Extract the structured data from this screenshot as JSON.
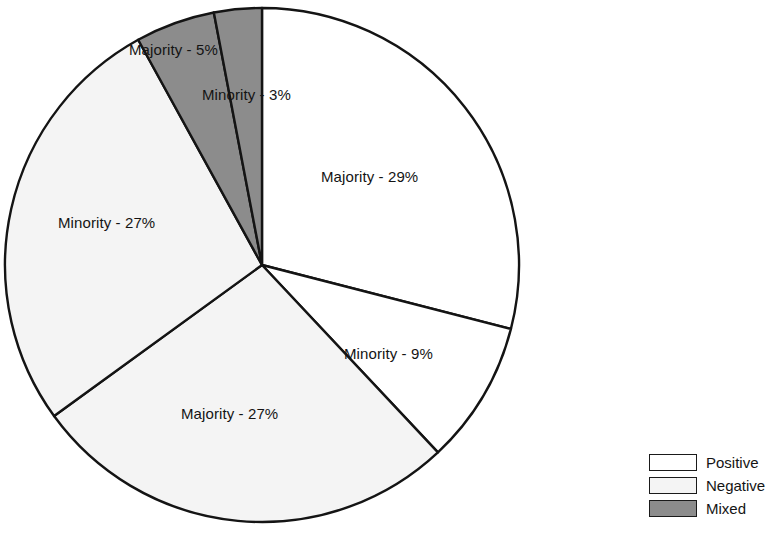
{
  "chart_data": {
    "type": "pie",
    "title": "",
    "subtitle": "",
    "xlabel": "",
    "ylabel": "",
    "grid": false,
    "legend_position": "bottom-right",
    "start_angle_deg": 0,
    "direction": "clockwise",
    "categories": [
      "Majority - 29%",
      "Minority - 9%",
      "Majority - 27%",
      "Minority - 27%",
      "Majority - 5%",
      "Minority - 3%"
    ],
    "values": [
      29,
      9,
      27,
      27,
      5,
      3
    ],
    "slices": [
      {
        "label": "Majority - 29%",
        "group": "Majority",
        "value": 29,
        "series": "Positive",
        "fill": "#ffffff",
        "label_x": 321,
        "label_y": 168
      },
      {
        "label": "Minority - 9%",
        "group": "Minority",
        "value": 9,
        "series": "Positive",
        "fill": "#ffffff",
        "label_x": 344,
        "label_y": 345
      },
      {
        "label": "Majority - 27%",
        "group": "Majority",
        "value": 27,
        "series": "Negative",
        "fill": "#f4f4f4",
        "label_x": 181,
        "label_y": 405
      },
      {
        "label": "Minority - 27%",
        "group": "Minority",
        "value": 27,
        "series": "Negative",
        "fill": "#f4f4f4",
        "label_x": 58,
        "label_y": 214
      },
      {
        "label": "Majority - 5%",
        "group": "Majority",
        "value": 5,
        "series": "Mixed",
        "fill": "#8c8c8c",
        "label_x": 129,
        "label_y": 41
      },
      {
        "label": "Minority - 3%",
        "group": "Minority",
        "value": 3,
        "series": "Mixed",
        "fill": "#8c8c8c",
        "label_x": 202,
        "label_y": 86
      }
    ],
    "legend": [
      {
        "label": "Positive",
        "color": "#ffffff"
      },
      {
        "label": "Negative",
        "color": "#f4f4f4"
      },
      {
        "label": "Mixed",
        "color": "#8c8c8c"
      }
    ],
    "geometry": {
      "center_x": 262,
      "center_y": 265,
      "radius": 257,
      "stroke": "#141414",
      "stroke_width": 2.4
    }
  }
}
